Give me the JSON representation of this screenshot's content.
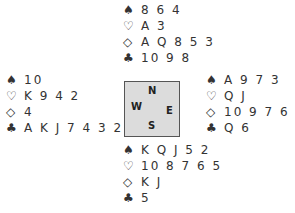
{
  "suit_symbols": {
    "spades": "♠",
    "hearts": "♡",
    "diamonds": "◇",
    "clubs": "♣"
  },
  "hands": {
    "north": {
      "spades": "8 6 4",
      "hearts": "A 3",
      "diamonds": "A Q 8 5 3",
      "clubs": "10 9 8"
    },
    "west": {
      "spades": "10",
      "hearts": "K 9 4 2",
      "diamonds": "4",
      "clubs": "A K J 7 4 3 2"
    },
    "east": {
      "spades": "A 9 7 3",
      "hearts": "Q J",
      "diamonds": "10 9 7 6 2",
      "clubs": "Q 6"
    },
    "south": {
      "spades": "K Q J 5 2",
      "hearts": "10 8 7 6 5",
      "diamonds": "K J",
      "clubs": "5"
    }
  },
  "compass": {
    "n": "N",
    "w": "W",
    "e": "E",
    "s": "S",
    "fill": "#dcdcdc"
  }
}
